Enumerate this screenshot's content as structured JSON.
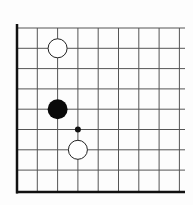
{
  "diagram": {
    "type": "go-board-corner",
    "corner": "bottom-left",
    "columns": 9,
    "rows": 9,
    "grid_origin": {
      "x": 17,
      "y": 28
    },
    "spacing": 20.3,
    "grid_right_x": 185,
    "edge_bottom_y": 192,
    "colors": {
      "background": "#fdfdfd",
      "line": "#555555",
      "edge": "#111111",
      "black_stone": "#0a0a0a",
      "white_stone_fill": "#ffffff",
      "white_stone_stroke": "#222222",
      "marker": "#111111"
    },
    "stones": [
      {
        "color": "white",
        "col": 2,
        "row": 1
      },
      {
        "color": "black",
        "col": 2,
        "row": 4
      },
      {
        "color": "white",
        "col": 3,
        "row": 6
      }
    ],
    "markers": [
      {
        "type": "dot",
        "col": 3,
        "row": 5
      }
    ]
  }
}
